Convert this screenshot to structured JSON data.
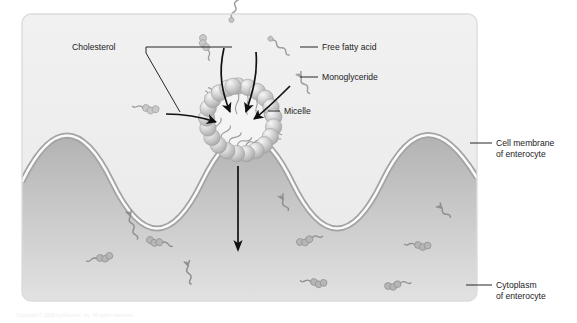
{
  "figure": {
    "panel": {
      "x": 22,
      "y": 14,
      "width": 455,
      "height": 287,
      "corner_radius": 9,
      "lumen_color": "#efefef",
      "cytoplasm_color_top": "#b4b4b4",
      "cytoplasm_color_bottom": "#dedede",
      "border_color": "#d9d9d9"
    },
    "membrane": {
      "label": "cell membrane",
      "outer_color": "#a9a9a9",
      "inner_color": "#fbfbfb",
      "band_thickness": 4.6,
      "wave_baseline_y": 182,
      "wave_amplitude": 27,
      "wave_count": 3.5
    }
  },
  "labels": {
    "cholesterol": "Cholesterol",
    "free_fatty_acid": "Free fatty acid",
    "monoglyceride": "Monoglyceride",
    "micelle": "Micelle",
    "cell_membrane_line1": "Cell membrane",
    "cell_membrane_line2": "of enterocyte",
    "cytoplasm_line1": "Cytoplasm",
    "cytoplasm_line2": "of enterocyte"
  },
  "micelle": {
    "center_x": 238,
    "center_y": 122,
    "head_ring_radius": 36,
    "head_radius": 8.2,
    "head_count": 22,
    "head_color": "#c9c9c9",
    "head_highlight": "#f2f2f2",
    "tail_color": "#9a9a9a",
    "core_color": "#f4f4f4"
  },
  "arrows": {
    "into_micelle_count": 4,
    "uptake_arrow": {
      "x": 238,
      "y_start": 166,
      "y_end": 247,
      "color": "#111111",
      "description": "micelle contents move into enterocyte cytoplasm"
    }
  },
  "molecules": {
    "lumen_free_fatty_acid": [
      {
        "x": 230,
        "y": 20,
        "rot": -72,
        "len": 30
      },
      {
        "x": 274,
        "y": 42,
        "rot": 38,
        "len": 24
      },
      {
        "x": 296,
        "y": 80,
        "rot": 22,
        "len": 22
      }
    ],
    "lumen_cholesterol": [
      {
        "x": 208,
        "y": 42,
        "rot": 74
      },
      {
        "x": 150,
        "y": 110,
        "rot": 14
      }
    ],
    "cytoplasm": [
      {
        "type": "ffa",
        "x": 128,
        "y": 215,
        "rot": 70,
        "len": 28
      },
      {
        "type": "ffa",
        "x": 185,
        "y": 265,
        "rot": 74,
        "len": 22
      },
      {
        "type": "chol",
        "x": 153,
        "y": 242,
        "rot": 18
      },
      {
        "type": "chol",
        "x": 105,
        "y": 260,
        "rot": -8
      },
      {
        "type": "chol",
        "x": 305,
        "y": 244,
        "rot": -12
      },
      {
        "type": "chol",
        "x": 318,
        "y": 284,
        "rot": 10
      },
      {
        "type": "ffa",
        "x": 280,
        "y": 200,
        "rot": 60,
        "len": 20
      },
      {
        "type": "chol",
        "x": 420,
        "y": 247,
        "rot": 8
      },
      {
        "type": "chol",
        "x": 392,
        "y": 288,
        "rot": -6
      },
      {
        "type": "ffa",
        "x": 436,
        "y": 210,
        "rot": 42,
        "len": 18
      }
    ]
  },
  "leaders": {
    "cholesterol_text_anchor": {
      "x": 142,
      "y": 50
    },
    "free_fatty_acid_text": {
      "x": 322,
      "y": 50
    },
    "monoglyceride_text": {
      "x": 322,
      "y": 79
    },
    "micelle_text": {
      "x": 283,
      "y": 113
    },
    "cell_membrane_text": {
      "x": 494,
      "y": 146
    },
    "cytoplasm_text": {
      "x": 494,
      "y": 287
    }
  },
  "footer_caption": "Copyright © 2006 by Elsevier, Inc. All rights reserved."
}
